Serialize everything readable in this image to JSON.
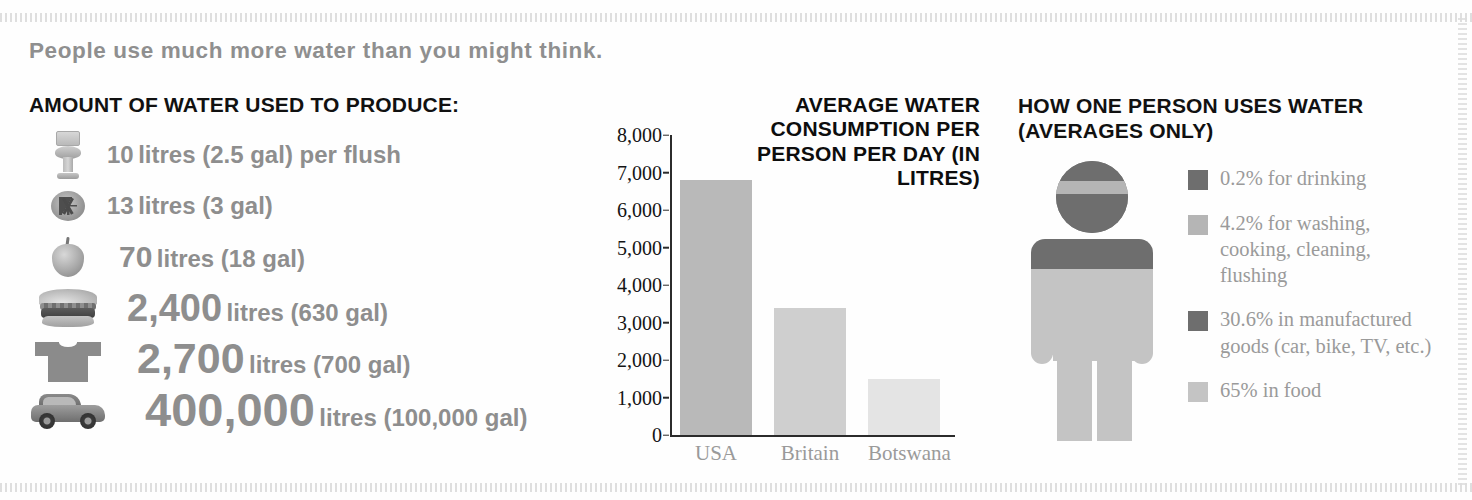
{
  "headline": "People use much more water than you might think.",
  "left_panel": {
    "title": "AMOUNT OF WATER USED TO PRODUCE:",
    "items": [
      {
        "icon": "toilet-icon",
        "number": "10",
        "unit": "litres (2.5 gal) per flush"
      },
      {
        "icon": "tomato-icon",
        "number": "13",
        "unit": "litres (3 gal)"
      },
      {
        "icon": "apple-icon",
        "number": "70",
        "unit": "litres (18 gal)"
      },
      {
        "icon": "burger-icon",
        "number": "2,400",
        "unit": "litres (630 gal)"
      },
      {
        "icon": "tshirt-icon",
        "number": "2,700",
        "unit": "litres (700 gal)"
      },
      {
        "icon": "car-icon",
        "number": "400,000",
        "unit": "litres (100,000 gal)"
      }
    ]
  },
  "chart_panel": {
    "title": "AVERAGE WATER CONSUMPTION PER PERSON PER DAY (IN LITRES)"
  },
  "right_panel": {
    "title": "HOW ONE PERSON USES WATER (AVERAGES ONLY)",
    "figure_name": "person-pictogram",
    "legend": [
      {
        "label": "0.2% for drinking",
        "color": "#6e6e6e"
      },
      {
        "label": "4.2% for washing, cooking, cleaning, flushing",
        "color": "#b5b5b5"
      },
      {
        "label": "30.6% in manufactured goods (car, bike, TV, etc.)",
        "color": "#6e6e6e"
      },
      {
        "label": "65% in food",
        "color": "#c4c4c4"
      }
    ]
  },
  "chart_data": {
    "type": "bar",
    "title": "AVERAGE WATER CONSUMPTION PER PERSON PER DAY (IN LITRES)",
    "xlabel": "",
    "ylabel": "litres",
    "categories": [
      "USA",
      "Britain",
      "Botswana"
    ],
    "values": [
      6800,
      3400,
      1500
    ],
    "colors": [
      "#b9b9b9",
      "#cfcfcf",
      "#e4e4e4"
    ],
    "ylim": [
      0,
      8000
    ],
    "ytick_labels": [
      "8,000",
      "7,000",
      "6,000",
      "5,000",
      "4,000",
      "3,000",
      "2,000",
      "1,000",
      "0"
    ],
    "ytick_values": [
      8000,
      7000,
      6000,
      5000,
      4000,
      3000,
      2000,
      1000,
      0
    ],
    "grid": false,
    "legend_position": "none"
  }
}
